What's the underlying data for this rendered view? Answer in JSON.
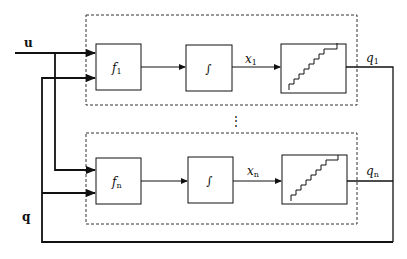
{
  "diagram": {
    "inputs": {
      "u_label": "u",
      "q_label": "q"
    },
    "channels": [
      {
        "function_label": "f",
        "function_subscript": "1",
        "integrator_label": "∫",
        "state_label": "x",
        "state_subscript": "1",
        "quantizer_icon": "staircase",
        "output_label": "q",
        "output_subscript": "1"
      },
      {
        "function_label": "f",
        "function_subscript": "n",
        "integrator_label": "∫",
        "state_label": "x",
        "state_subscript": "n",
        "quantizer_icon": "staircase",
        "output_label": "q",
        "output_subscript": "n"
      }
    ],
    "ellipsis": "⋮",
    "colors": {
      "line": "#111111",
      "dashed_border": "#333333",
      "background": "#ffffff"
    }
  }
}
